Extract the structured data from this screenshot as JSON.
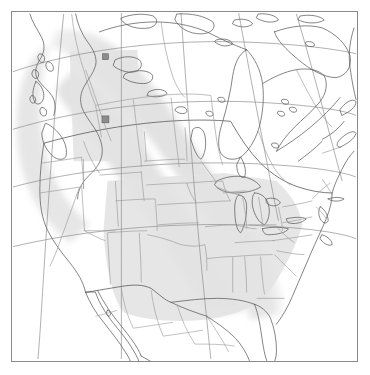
{
  "map": {
    "title": "North America base map with diagonal shaded corridor",
    "projection": "conic",
    "canvas": {
      "width": 370,
      "height": 375
    },
    "frame": {
      "x": 11,
      "y": 11,
      "width": 347,
      "height": 351,
      "border_color": "#8a8a8a",
      "background": "#ffffff"
    },
    "colors": {
      "ocean": "#ffffff",
      "land_fill": "#ffffff",
      "shaded_band": "#e2e2e2",
      "shaded_band_soft": "#ededed",
      "country_outline": "#5a5a5a",
      "state_outline": "#9a9a9a",
      "graticule": "#8f8f8f",
      "marker_fill": "#8c8c8c",
      "marker_stroke": "#555555"
    },
    "shaded_band": {
      "label": "shaded corridor",
      "fill": "#e2e2e2",
      "opacity": 0.95,
      "description": "Broad diagonal band running from northwest Canada southeast across the Great Plains to the southeastern United States coast",
      "northwest_extent": "Yukon / northern British Columbia",
      "southeast_extent": "Carolinas / Georgia coast"
    },
    "markers": [
      {
        "name": "marker-north",
        "x": 105,
        "y": 56,
        "size": 6,
        "fill": "#8c8c8c",
        "region": "Great Slave Lake area, Northwest Territories"
      },
      {
        "name": "marker-south",
        "x": 105,
        "y": 119,
        "size": 7,
        "fill": "#8c8c8c",
        "region": "central Alberta"
      }
    ],
    "graticule": {
      "visible": true,
      "meridians": 5,
      "parallels": 4,
      "color": "#8f8f8f"
    },
    "features": {
      "countries": [
        "Canada",
        "United States",
        "Mexico"
      ],
      "water_bodies": [
        "Hudson Bay",
        "Great Lakes",
        "Gulf of Mexico",
        "Great Slave Lake",
        "Great Bear Lake",
        "Lake Winnipeg",
        "Gulf of California"
      ],
      "has_state_boundaries": true,
      "has_province_boundaries": true,
      "has_labels": false,
      "has_legend": false,
      "has_scale_bar": false,
      "has_north_arrow": false
    }
  }
}
